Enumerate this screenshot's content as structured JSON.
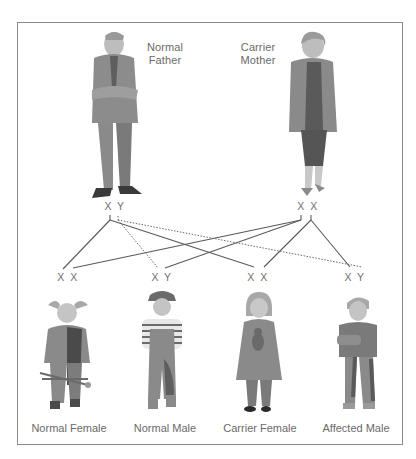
{
  "parents": {
    "father": {
      "label_line1": "Normal",
      "label_line2": "Father",
      "genotype": "X Y"
    },
    "mother": {
      "label_line1": "Carrier",
      "label_line2": "Mother",
      "genotype": "X X"
    }
  },
  "children": [
    {
      "label": "Normal Female",
      "genotype": "X X"
    },
    {
      "label": "Normal Male",
      "genotype": "X Y"
    },
    {
      "label": "Carrier Female",
      "genotype": "X X"
    },
    {
      "label": "Affected Male",
      "genotype": "X Y"
    }
  ],
  "inheritance_lines": [
    {
      "from": "father-X",
      "to": "normal-female",
      "style": "solid"
    },
    {
      "from": "father-X",
      "to": "carrier-female",
      "style": "solid"
    },
    {
      "from": "father-Y",
      "to": "normal-male",
      "style": "dotted"
    },
    {
      "from": "father-Y",
      "to": "affected-male",
      "style": "dotted"
    },
    {
      "from": "mother-X1",
      "to": "normal-female",
      "style": "solid"
    },
    {
      "from": "mother-X1",
      "to": "normal-male",
      "style": "solid"
    },
    {
      "from": "mother-X2",
      "to": "carrier-female",
      "style": "solid"
    },
    {
      "from": "mother-X2",
      "to": "affected-male",
      "style": "solid"
    }
  ],
  "colors": {
    "frame": "#8a8a8a",
    "line": "#5a5a5a",
    "text": "#6a6a6a"
  }
}
